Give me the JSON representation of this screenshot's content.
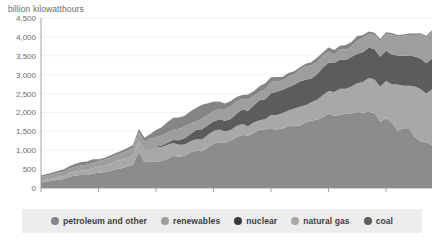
{
  "chart_data": {
    "type": "area",
    "stacked": true,
    "title": "billion kilowatthours",
    "xlabel": "",
    "ylabel": "billion kilowatthours",
    "ylim": [
      0,
      4500
    ],
    "xlim": [
      1950,
      2018
    ],
    "ytick_labels": [
      "4,500",
      "4,000",
      "3,500",
      "3,000",
      "2,500",
      "2,000",
      "1,500",
      "1,000",
      "500",
      "0"
    ],
    "ytick_values": [
      4500,
      4000,
      3500,
      3000,
      2500,
      2000,
      1500,
      1000,
      500,
      0
    ],
    "xtick_labels": [
      "1950",
      "1960",
      "1970",
      "1980",
      "1990",
      "2000",
      "2010"
    ],
    "xtick_values": [
      1950,
      1960,
      1970,
      1980,
      1990,
      2000,
      2010
    ],
    "grid": true,
    "legend_position": "bottom",
    "colors": {
      "coal": "#8c8c8c",
      "natural_gas": "#a8a8a8",
      "nuclear": "#6e6e6e",
      "renewables": "#9e9e9e",
      "petroleum_and_other": "#858585",
      "background": "#ffffff",
      "legend_background": "#ededed",
      "axis": "#8a8a8a",
      "grid": "#e9e9e9",
      "text": "#6b6b6b"
    },
    "x": [
      1950,
      1951,
      1952,
      1953,
      1954,
      1955,
      1956,
      1957,
      1958,
      1959,
      1960,
      1961,
      1962,
      1963,
      1964,
      1965,
      1966,
      1967,
      1968,
      1969,
      1970,
      1971,
      1972,
      1973,
      1974,
      1975,
      1976,
      1977,
      1978,
      1979,
      1980,
      1981,
      1982,
      1983,
      1984,
      1985,
      1986,
      1987,
      1988,
      1989,
      1990,
      1991,
      1992,
      1993,
      1994,
      1995,
      1996,
      1997,
      1998,
      1999,
      2000,
      2001,
      2002,
      2003,
      2004,
      2005,
      2006,
      2007,
      2008,
      2009,
      2010,
      2011,
      2012,
      2013,
      2014,
      2015,
      2016,
      2017,
      2018
    ],
    "series": [
      {
        "name": "coal",
        "color": "#8c8c8c",
        "stack_order": 1,
        "values": [
          155,
          175,
          192,
          218,
          239,
          301,
          330,
          346,
          345,
          381,
          403,
          422,
          450,
          494,
          526,
          571,
          613,
          976,
          684,
          706,
          704,
          713,
          771,
          848,
          828,
          853,
          944,
          985,
          976,
          1075,
          1162,
          1203,
          1192,
          1259,
          1342,
          1402,
          1386,
          1464,
          1541,
          1554,
          1560,
          1551,
          1576,
          1639,
          1636,
          1653,
          1737,
          1788,
          1807,
          1881,
          1966,
          1904,
          1933,
          1974,
          1978,
          2013,
          1991,
          2016,
          1986,
          1756,
          1847,
          1733,
          1514,
          1581,
          1582,
          1352,
          1240,
          1206,
          1146
        ]
      },
      {
        "name": "natural gas",
        "color": "#a8a8a8",
        "stack_order": 2,
        "values": [
          45,
          52,
          60,
          70,
          80,
          95,
          105,
          115,
          120,
          140,
          158,
          169,
          183,
          202,
          220,
          222,
          250,
          268,
          306,
          333,
          373,
          374,
          376,
          341,
          320,
          300,
          295,
          306,
          305,
          329,
          346,
          346,
          305,
          274,
          297,
          292,
          248,
          273,
          253,
          267,
          373,
          381,
          404,
          415,
          460,
          496,
          455,
          479,
          532,
          571,
          601,
          639,
          691,
          650,
          710,
          761,
          816,
          897,
          883,
          921,
          988,
          1014,
          1226,
          1125,
          1127,
          1335,
          1380,
          1297,
          1468
        ]
      },
      {
        "name": "nuclear",
        "color": "#5c5c5c",
        "stack_order": 3,
        "values": [
          0,
          0,
          0,
          0,
          0,
          0,
          0,
          0,
          0.2,
          0.2,
          0.5,
          1,
          2,
          3,
          3,
          4,
          5,
          8,
          12,
          14,
          22,
          38,
          54,
          83,
          114,
          173,
          191,
          251,
          276,
          255,
          251,
          273,
          283,
          294,
          328,
          384,
          414,
          455,
          527,
          529,
          577,
          613,
          619,
          610,
          640,
          673,
          675,
          629,
          674,
          728,
          754,
          769,
          780,
          764,
          789,
          782,
          787,
          806,
          806,
          799,
          807,
          790,
          769,
          789,
          797,
          797,
          806,
          805,
          807
        ]
      },
      {
        "name": "renewables",
        "color": "#9e9e9e",
        "stack_order": 4,
        "values": [
          101,
          105,
          112,
          113,
          114,
          117,
          128,
          140,
          148,
          141,
          149,
          153,
          173,
          170,
          178,
          197,
          195,
          222,
          222,
          250,
          250,
          266,
          274,
          272,
          304,
          300,
          284,
          221,
          283,
          280,
          279,
          261,
          309,
          330,
          321,
          284,
          292,
          250,
          223,
          266,
          293,
          283,
          249,
          280,
          261,
          310,
          358,
          356,
          323,
          320,
          290,
          219,
          264,
          280,
          268,
          343,
          383,
          352,
          375,
          417,
          428,
          520,
          501,
          534,
          546,
          568,
          631,
          687,
          713
        ]
      },
      {
        "name": "petroleum and other",
        "color": "#858585",
        "stack_order": 5,
        "values": [
          33,
          40,
          48,
          55,
          63,
          70,
          78,
          88,
          90,
          98,
          48,
          50,
          52,
          56,
          62,
          65,
          75,
          85,
          104,
          127,
          184,
          220,
          274,
          314,
          300,
          289,
          320,
          358,
          365,
          304,
          246,
          206,
          147,
          144,
          120,
          100,
          136,
          118,
          149,
          158,
          127,
          111,
          89,
          100,
          91,
          60,
          67,
          77,
          110,
          86,
          111,
          125,
          95,
          119,
          121,
          122,
          70,
          74,
          59,
          53,
          54,
          44,
          37,
          36,
          39,
          40,
          37,
          36,
          39
        ]
      }
    ],
    "notes": {
      "peak_total_year": 2007,
      "peak_total_value": 4145,
      "coal_peak_year": 2007,
      "coal_peak_value": 2016
    }
  },
  "legend": {
    "items": [
      {
        "label": "petroleum and other",
        "color": "#858585",
        "icon": "circle-marker"
      },
      {
        "label": "renewables",
        "color": "#9e9e9e",
        "icon": "circle-marker"
      },
      {
        "label": "nuclear",
        "color": "#3a3a3a",
        "icon": "circle-marker"
      },
      {
        "label": "natural gas",
        "color": "#a8a8a8",
        "icon": "circle-marker"
      },
      {
        "label": "coal",
        "color": "#5e5e5e",
        "icon": "circle-marker"
      }
    ]
  }
}
